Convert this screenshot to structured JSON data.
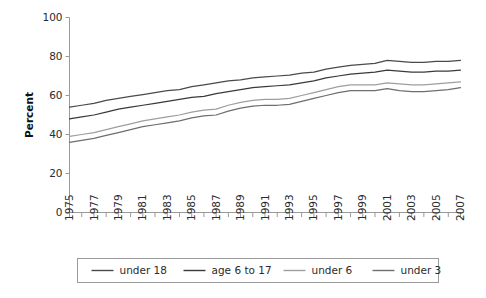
{
  "chart_data": {
    "type": "line",
    "title": "",
    "xlabel": "",
    "ylabel": "Percent",
    "ylim": [
      0,
      100
    ],
    "xlim": [
      1975,
      2007
    ],
    "grid": false,
    "legend_position": "bottom",
    "ytick_labels": [
      "0",
      "20",
      "40",
      "60",
      "80",
      "100"
    ],
    "ytick_values": [
      0,
      20,
      40,
      60,
      80,
      100
    ],
    "x": [
      1975,
      1976,
      1977,
      1978,
      1979,
      1980,
      1981,
      1982,
      1983,
      1984,
      1985,
      1986,
      1987,
      1988,
      1989,
      1990,
      1991,
      1992,
      1993,
      1994,
      1995,
      1996,
      1997,
      1998,
      1999,
      2000,
      2001,
      2002,
      2003,
      2004,
      2005,
      2006,
      2007
    ],
    "xtick_labels": [
      "1975",
      "1977",
      "1979",
      "1981",
      "1983",
      "1985",
      "1987",
      "1989",
      "1991",
      "1993",
      "1995",
      "1997",
      "1999",
      "2001",
      "2003",
      "2005",
      "2007"
    ],
    "xtick_values": [
      1975,
      1977,
      1979,
      1981,
      1983,
      1985,
      1987,
      1989,
      1991,
      1993,
      1995,
      1997,
      1999,
      2001,
      2003,
      2005,
      2007
    ],
    "series": [
      {
        "name": "under 18",
        "color": "#4a4a4a",
        "values": [
          54.0,
          55.0,
          56.0,
          57.5,
          58.5,
          59.5,
          60.5,
          61.5,
          62.5,
          63.0,
          64.5,
          65.5,
          66.5,
          67.5,
          68.0,
          69.0,
          69.5,
          70.0,
          70.5,
          71.5,
          72.0,
          73.5,
          74.5,
          75.5,
          76.0,
          76.5,
          78.0,
          77.5,
          77.0,
          77.0,
          77.5,
          77.5,
          78.0
        ]
      },
      {
        "name": "age 6 to 17",
        "color": "#3a3a3a",
        "values": [
          48.0,
          49.0,
          50.0,
          51.5,
          53.0,
          54.0,
          55.0,
          56.0,
          57.0,
          58.0,
          59.0,
          59.5,
          61.0,
          62.0,
          63.0,
          64.0,
          64.5,
          65.0,
          65.5,
          66.5,
          67.5,
          69.0,
          70.0,
          71.0,
          71.5,
          72.0,
          73.0,
          72.5,
          72.0,
          72.0,
          72.5,
          72.5,
          73.0
        ]
      },
      {
        "name": "under 6",
        "color": "#9e9e9e",
        "values": [
          39.0,
          40.0,
          41.0,
          42.5,
          44.0,
          45.5,
          47.0,
          48.0,
          49.0,
          50.0,
          51.5,
          52.5,
          53.0,
          55.0,
          56.5,
          57.5,
          58.0,
          58.0,
          58.5,
          60.0,
          61.5,
          63.0,
          64.5,
          65.5,
          65.5,
          65.5,
          66.5,
          66.0,
          65.5,
          65.5,
          66.0,
          66.5,
          67.0
        ]
      },
      {
        "name": "under 3",
        "color": "#6e6e6e",
        "values": [
          36.0,
          37.0,
          38.0,
          39.5,
          41.0,
          42.5,
          44.0,
          45.0,
          46.0,
          47.0,
          48.5,
          49.5,
          50.0,
          52.0,
          53.5,
          54.5,
          55.0,
          55.0,
          55.5,
          57.0,
          58.5,
          60.0,
          61.5,
          62.5,
          62.5,
          62.5,
          63.5,
          62.5,
          62.0,
          62.0,
          62.5,
          63.0,
          64.0
        ]
      }
    ]
  },
  "legend": {
    "items": [
      {
        "label": "under 18"
      },
      {
        "label": "age 6 to 17"
      },
      {
        "label": "under 6"
      },
      {
        "label": "under 3"
      }
    ]
  }
}
